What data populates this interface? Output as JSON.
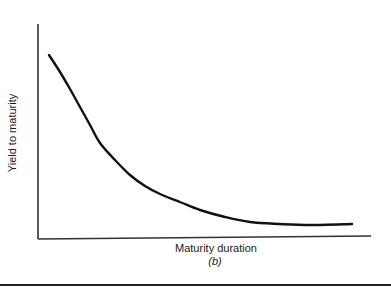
{
  "chart_data": {
    "type": "line",
    "title": "",
    "subtitle": "(b)",
    "xlabel": "Maturity duration",
    "ylabel": "Yield to maturity",
    "x_ticks": [],
    "y_ticks": [],
    "grid": false,
    "legend": null,
    "series": [
      {
        "name": "Yield curve (inverted / downward sloping)",
        "shape": "decreasing convex curve that flattens toward an asymptote",
        "points_px": [
          [
            49,
            55
          ],
          [
            60,
            72
          ],
          [
            70,
            89
          ],
          [
            80,
            107
          ],
          [
            90,
            125
          ],
          [
            100,
            143
          ],
          [
            115,
            160
          ],
          [
            130,
            175
          ],
          [
            145,
            186
          ],
          [
            160,
            194
          ],
          [
            180,
            202
          ],
          [
            200,
            210
          ],
          [
            225,
            217
          ],
          [
            250,
            222
          ],
          [
            280,
            224
          ],
          [
            310,
            225
          ],
          [
            352,
            224
          ]
        ]
      }
    ],
    "axes": {
      "origin_px": [
        38,
        239
      ],
      "y_axis_top_px": 24,
      "x_axis_end_px": [
        371,
        236
      ]
    }
  },
  "labels": {
    "ylabel": "Yield to maturity",
    "xlabel": "Maturity duration",
    "panel": "(b)"
  },
  "colors": {
    "line": "#111111",
    "axis": "#333333",
    "background": "#ffffff"
  }
}
